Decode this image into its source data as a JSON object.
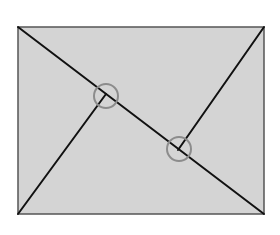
{
  "diagram": {
    "title": "",
    "colors": {
      "background": "#ffffff",
      "rect_fill": "#d4d4d4",
      "rect_stroke": "#555555",
      "line": "#111111",
      "circle": "#8c8c8c"
    },
    "rect": {
      "x": 18,
      "y": 27,
      "width": 246,
      "height": 187
    },
    "lines": [
      {
        "id": "diagonal",
        "x1": 18,
        "y1": 27,
        "x2": 264,
        "y2": 214
      },
      {
        "id": "left-perpendicular",
        "x1": 18,
        "y1": 214,
        "x2": 106,
        "y2": 94
      },
      {
        "id": "right-perpendicular",
        "x1": 264,
        "y1": 27,
        "x2": 178,
        "y2": 150
      }
    ],
    "circles": [
      {
        "id": "intersection-marker-1",
        "cx": 106,
        "cy": 96,
        "r": 12
      },
      {
        "id": "intersection-marker-2",
        "cx": 179,
        "cy": 149,
        "r": 12
      }
    ]
  }
}
